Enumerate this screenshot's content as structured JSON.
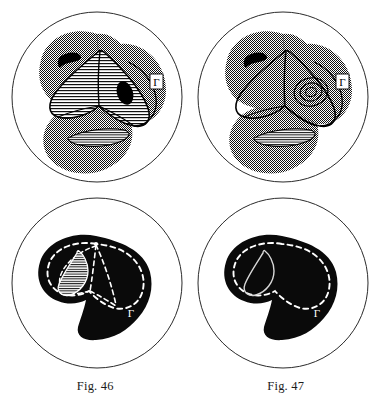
{
  "plate": {
    "background_color": "#ffffff",
    "ink_color": "#000000",
    "stipple_gray": "#808080",
    "outline_circle_color": "#2b2b2b"
  },
  "captions": [
    {
      "id": "fig-46",
      "text": "Fig. 46"
    },
    {
      "id": "fig-47",
      "text": "Fig. 47"
    }
  ],
  "panels": [
    {
      "id": "panel-top-left",
      "row": "top",
      "column": "left",
      "belongs_to_figure": "Fig. 46",
      "style": "stippled-lobes-with-hatching",
      "label": "Γ",
      "label_style": "black-on-white-box",
      "circle": {
        "cx": 97,
        "cy": 97,
        "r": 85
      },
      "features": [
        "three overlapping stippled lobes",
        "central hatched tri-lobed region",
        "black crescent spot upper left",
        "black oval spot center right",
        "white hatched lens lower center"
      ]
    },
    {
      "id": "panel-top-right",
      "row": "top",
      "column": "right",
      "belongs_to_figure": "Fig. 47",
      "style": "stippled-lobes-with-contours",
      "label": "Γ",
      "label_style": "black-on-white-box",
      "circle": {
        "cx": 283,
        "cy": 97,
        "r": 85
      },
      "features": [
        "three overlapping stippled lobes",
        "central region outlined with nested contour loops",
        "black crescent spot upper left",
        "concentric rings center right",
        "white hatched lens lower center"
      ]
    },
    {
      "id": "panel-bottom-left",
      "row": "bottom",
      "column": "left",
      "belongs_to_figure": "Fig. 46",
      "style": "black-silhouette-with-dashed-contours",
      "label": "Γ",
      "label_style": "white-on-black",
      "circle": {
        "cx": 97,
        "cy": 283,
        "r": 85
      },
      "features": [
        "solid black kidney silhouette",
        "white dashed outer contour",
        "white dashed radial lines from apex",
        "hatched teardrop inset left of center"
      ]
    },
    {
      "id": "panel-bottom-right",
      "row": "bottom",
      "column": "right",
      "belongs_to_figure": "Fig. 47",
      "style": "black-silhouette-with-dashed-contour",
      "label": "Γ",
      "label_style": "white-on-black",
      "circle": {
        "cx": 283,
        "cy": 283,
        "r": 85
      },
      "features": [
        "solid black kidney silhouette",
        "white dashed outer contour",
        "single white teardrop outline left of center"
      ]
    }
  ]
}
